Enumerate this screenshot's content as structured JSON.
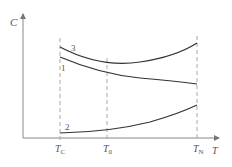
{
  "diagram": {
    "y_axis_label": "C",
    "x_axis_label": "T",
    "ticks": [
      {
        "main": "T",
        "sub": "C",
        "x": 60
      },
      {
        "main": "T",
        "sub": "0",
        "x": 107
      },
      {
        "main": "T",
        "sub": "N",
        "x": 197
      }
    ],
    "curves": [
      {
        "label": "3",
        "description": "U-shaped curve, min near T0"
      },
      {
        "label": "1",
        "description": "decreasing curve"
      },
      {
        "label": "2",
        "description": "increasing curve"
      }
    ],
    "colors": {
      "axis": "#888888",
      "curve": "#333333",
      "dashed": "#aaaaaa",
      "text": "#555555"
    }
  }
}
